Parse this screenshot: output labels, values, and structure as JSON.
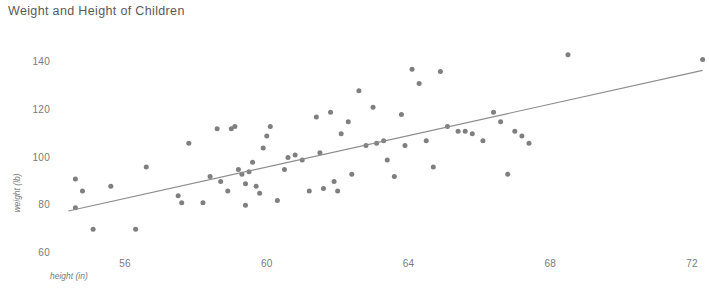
{
  "chart_data": {
    "type": "scatter",
    "title": "Weight and Height of Children",
    "xlabel": "height (in)",
    "ylabel": "weight (lb)",
    "xlim": [
      54.4,
      72.5
    ],
    "ylim": [
      56,
      146
    ],
    "xticks": [
      56,
      60,
      64,
      68,
      72
    ],
    "yticks": [
      60,
      80,
      100,
      120,
      140
    ],
    "xtick_labels": [
      "56",
      "60",
      "64",
      "68",
      "72"
    ],
    "ytick_labels": [
      "60",
      "80",
      "100",
      "120",
      "140"
    ],
    "grid": false,
    "legend": false,
    "marker_color": "#7f7f7f",
    "trendline_color": "#8c8c8c",
    "series": [
      {
        "name": "children",
        "x": [
          54.6,
          54.6,
          54.8,
          55.1,
          55.6,
          56.3,
          56.6,
          57.5,
          57.6,
          57.8,
          58.2,
          58.4,
          58.6,
          58.7,
          58.9,
          59.0,
          59.1,
          59.2,
          59.3,
          59.4,
          59.4,
          59.5,
          59.6,
          59.7,
          59.8,
          59.9,
          60.0,
          60.1,
          60.3,
          60.5,
          60.6,
          60.8,
          61.0,
          61.2,
          61.4,
          61.5,
          61.6,
          61.8,
          61.9,
          62.0,
          62.1,
          62.3,
          62.4,
          62.6,
          62.8,
          63.0,
          63.1,
          63.3,
          63.4,
          63.6,
          63.8,
          63.9,
          64.1,
          64.3,
          64.5,
          64.7,
          64.9,
          65.1,
          65.4,
          65.6,
          65.8,
          66.1,
          66.4,
          66.6,
          66.8,
          67.0,
          67.2,
          67.4,
          68.5,
          72.3
        ],
        "y": [
          91,
          79,
          86,
          70,
          88,
          70,
          96,
          84,
          81,
          106,
          81,
          92,
          112,
          90,
          86,
          112,
          113,
          95,
          93,
          80,
          89,
          94,
          98,
          88,
          85,
          104,
          109,
          113,
          82,
          95,
          100,
          101,
          99,
          86,
          117,
          102,
          87,
          119,
          90,
          86,
          110,
          115,
          93,
          128,
          105,
          121,
          106,
          107,
          99,
          92,
          118,
          105,
          137,
          131,
          107,
          96,
          136,
          113,
          111,
          111,
          110,
          107,
          119,
          115,
          93,
          111,
          109,
          106,
          143,
          141
        ]
      }
    ],
    "trendline": {
      "x": [
        54.4,
        72.3
      ],
      "y": [
        77.6,
        136.5
      ]
    }
  }
}
